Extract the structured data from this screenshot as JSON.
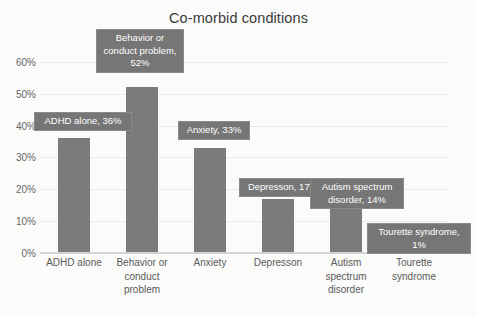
{
  "chart_data": {
    "type": "bar",
    "title": "Co-morbid conditions",
    "xlabel": "",
    "ylabel": "",
    "ylim": [
      0,
      65
    ],
    "grid": true,
    "legend": "none",
    "categories": [
      "ADHD alone",
      "Behavior or conduct problem",
      "Anxiety",
      "Depresson",
      "Autism spectrum disorder",
      "Tourette syndrome"
    ],
    "category_lines": [
      [
        "ADHD alone"
      ],
      [
        "Behavior or",
        "conduct",
        "problem"
      ],
      [
        "Anxiety"
      ],
      [
        "Depresson"
      ],
      [
        "Autism",
        "spectrum",
        "disorder"
      ],
      [
        "Tourette",
        "syndrome"
      ]
    ],
    "values": [
      36,
      52,
      33,
      17,
      14,
      1
    ],
    "value_labels": [
      "36%",
      "52%",
      "33%",
      "17%",
      "14%",
      "1%"
    ],
    "data_labels": [
      "ADHD alone, 36%",
      "Behavior or\nconduct problem,\n52%",
      "Anxiety, 33%",
      "Depresson, 17%",
      "Autism spectrum\ndisorder, 14%",
      "Tourette syndrome,\n1%"
    ],
    "yticks": [
      0,
      10,
      20,
      30,
      40,
      50,
      60
    ],
    "ytick_labels": [
      "0%",
      "10%",
      "20%",
      "30%",
      "40%",
      "50%",
      "60%"
    ],
    "colors": {
      "bar": "#7b7b7b",
      "background": "#fbfbfa",
      "gridline": "#e9e9e9",
      "axis": "#d2d2d2",
      "label_box": "#767676",
      "label_text": "#ffffff",
      "title_text": "#3b3b3b",
      "tick_text": "#676767"
    }
  }
}
